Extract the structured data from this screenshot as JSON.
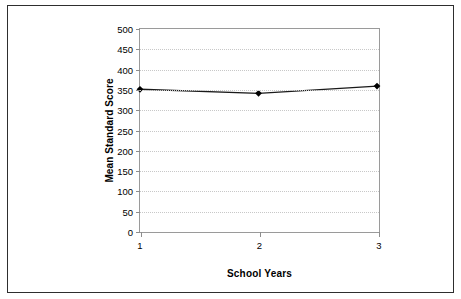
{
  "figure": {
    "background_color": "#ffffff",
    "frame_color": "#2e2e2e",
    "plot_border_color": "#9a9a9a",
    "gridline_color": "#c8c8c8"
  },
  "chart_data": {
    "type": "line",
    "title": "",
    "xlabel": "School Years",
    "ylabel": "Mean Standard Score",
    "categories": [
      "1",
      "2",
      "3"
    ],
    "x": [
      1,
      2,
      3
    ],
    "values": [
      350,
      340,
      358
    ],
    "series": [
      {
        "name": "Mean Standard Score",
        "values": [
          350,
          340,
          358
        ],
        "line_color": "#1a1a1a",
        "marker": "diamond",
        "marker_color": "#000000"
      }
    ],
    "ylim": [
      0,
      500
    ],
    "yticks": [
      0,
      50,
      100,
      150,
      200,
      250,
      300,
      350,
      400,
      450,
      500
    ],
    "ytick_labels": [
      "0",
      "50",
      "100",
      "150",
      "200",
      "250",
      "300",
      "350",
      "400",
      "450",
      "500"
    ],
    "xticks": [
      1,
      2,
      3
    ],
    "xtick_labels": [
      "1",
      "2",
      "3"
    ],
    "grid": true,
    "grid_axis": "y",
    "grid_style": "dotted",
    "legend": false,
    "legend_position": "none"
  }
}
